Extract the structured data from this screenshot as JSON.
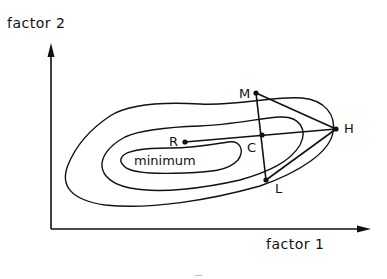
{
  "diagram": {
    "axes": {
      "y_label": "factor 2",
      "x_label": "factor 1"
    },
    "regions": {
      "minimum_label": "minimum"
    },
    "points": {
      "R": "R",
      "C": "C",
      "M": "M",
      "H": "H",
      "L": "L"
    },
    "colors": {
      "ink": "#111111",
      "background": "#ffffff"
    }
  }
}
